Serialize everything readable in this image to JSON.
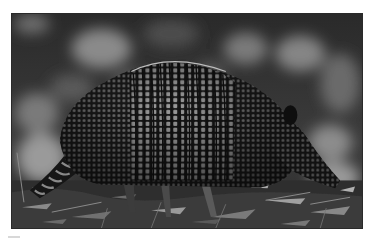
{
  "image": {
    "subject": "armadillo",
    "description": "Black-and-white photograph of a nine-banded armadillo walking on a leaf-littered forest floor, side profile facing right",
    "palette": {
      "background_page": "#ffffff",
      "frame_border": "#2a2a2a",
      "shell_dark": "#1c1c1c",
      "shell_light": "#9a9a9a",
      "bokeh_light": "#8c8c8c",
      "ground": "#3a3a3a"
    },
    "elements": [
      "bokeh-background",
      "armadillo-shell",
      "banded-midsection",
      "ringed-tail",
      "head",
      "ear",
      "front-leg",
      "hind-leg",
      "leaf-litter-ground",
      "twigs"
    ]
  }
}
